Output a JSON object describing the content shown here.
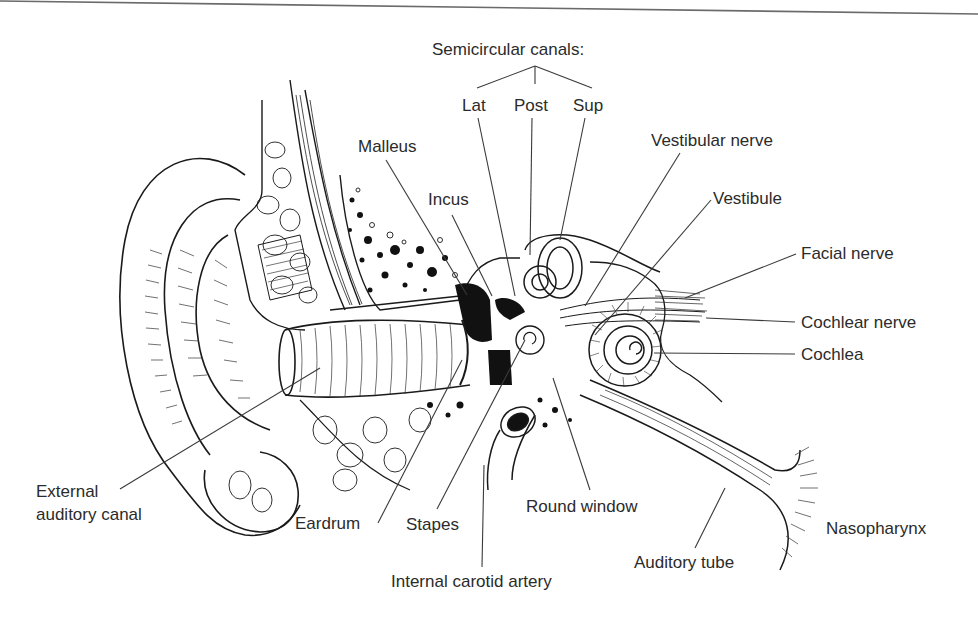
{
  "figure": {
    "top_rule": true
  },
  "labels": {
    "semicircular_canals": "Semicircular canals:",
    "lat": "Lat",
    "post": "Post",
    "sup": "Sup",
    "malleus": "Malleus",
    "incus": "Incus",
    "vestibular_nerve": "Vestibular nerve",
    "vestibule": "Vestibule",
    "facial_nerve": "Facial nerve",
    "cochlear_nerve": "Cochlear nerve",
    "cochlea": "Cochlea",
    "external_auditory_canal": "External\nauditory canal",
    "eardrum": "Eardrum",
    "stapes": "Stapes",
    "round_window": "Round window",
    "internal_carotid_artery": "Internal carotid artery",
    "auditory_tube": "Auditory tube",
    "nasopharynx": "Nasopharynx"
  },
  "label_positions": {
    "semicircular_canals": [
      432,
      40
    ],
    "lat": [
      462,
      96
    ],
    "post": [
      514,
      96
    ],
    "sup": [
      573,
      96
    ],
    "malleus": [
      358,
      137
    ],
    "incus": [
      428,
      190
    ],
    "vestibular_nerve": [
      651,
      131
    ],
    "vestibule": [
      713,
      189
    ],
    "facial_nerve": [
      801,
      244
    ],
    "cochlear_nerve": [
      801,
      313
    ],
    "cochlea": [
      801,
      345
    ],
    "external_auditory_canal": [
      36,
      480
    ],
    "eardrum": [
      295,
      514
    ],
    "stapes": [
      406,
      515
    ],
    "round_window": [
      526,
      497
    ],
    "internal_carotid_artery": [
      391,
      572
    ],
    "auditory_tube": [
      634,
      553
    ],
    "nasopharynx": [
      826,
      519
    ]
  },
  "leader_lines": [
    {
      "name": "semicircular-bracket-lat",
      "points": [
        [
          535,
          66
        ],
        [
          477,
          88
        ]
      ]
    },
    {
      "name": "semicircular-bracket-post",
      "points": [
        [
          535,
          66
        ],
        [
          535,
          84
        ]
      ]
    },
    {
      "name": "semicircular-bracket-sup",
      "points": [
        [
          535,
          66
        ],
        [
          592,
          88
        ]
      ]
    },
    {
      "name": "leader-lat",
      "points": [
        [
          478,
          118
        ],
        [
          515,
          296
        ]
      ]
    },
    {
      "name": "leader-post",
      "points": [
        [
          532,
          118
        ],
        [
          530,
          255
        ]
      ]
    },
    {
      "name": "leader-sup",
      "points": [
        [
          585,
          118
        ],
        [
          560,
          240
        ]
      ]
    },
    {
      "name": "leader-malleus",
      "points": [
        [
          386,
          160
        ],
        [
          467,
          295
        ]
      ]
    },
    {
      "name": "leader-incus",
      "points": [
        [
          452,
          215
        ],
        [
          492,
          296
        ]
      ]
    },
    {
      "name": "leader-vestibular-nerve",
      "points": [
        [
          680,
          153
        ],
        [
          585,
          306
        ]
      ]
    },
    {
      "name": "leader-vestibule",
      "points": [
        [
          711,
          200
        ],
        [
          595,
          335
        ]
      ]
    },
    {
      "name": "leader-facial-nerve",
      "points": [
        [
          796,
          254
        ],
        [
          685,
          298
        ]
      ]
    },
    {
      "name": "leader-cochlear-nerve",
      "points": [
        [
          795,
          322
        ],
        [
          706,
          318
        ]
      ]
    },
    {
      "name": "leader-cochlea",
      "points": [
        [
          795,
          354
        ],
        [
          654,
          353
        ]
      ]
    },
    {
      "name": "leader-external-auditory-canal",
      "points": [
        [
          120,
          489
        ],
        [
          320,
          368
        ]
      ]
    },
    {
      "name": "leader-eardrum",
      "points": [
        [
          378,
          523
        ],
        [
          462,
          360
        ]
      ]
    },
    {
      "name": "leader-stapes",
      "points": [
        [
          437,
          509
        ],
        [
          525,
          340
        ]
      ]
    },
    {
      "name": "leader-round-window",
      "points": [
        [
          590,
          490
        ],
        [
          553,
          378
        ]
      ]
    },
    {
      "name": "leader-internal-carotid",
      "points": [
        [
          482,
          567
        ],
        [
          484,
          465
        ]
      ]
    },
    {
      "name": "leader-auditory-tube",
      "points": [
        [
          695,
          548
        ],
        [
          725,
          488
        ]
      ]
    }
  ],
  "colors": {
    "ink": "#1a1a1a",
    "label_ink": "#2b2b2b",
    "leader": "#3a3a3a",
    "background": "#ffffff",
    "bone_fill": "#f3f3f3",
    "dark_fill": "#111111"
  }
}
